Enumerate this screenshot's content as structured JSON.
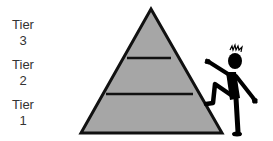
{
  "diagram": {
    "title": "",
    "tiers": [
      {
        "word": "Tier",
        "number": "3"
      },
      {
        "word": "Tier",
        "number": "2"
      },
      {
        "word": "Tier",
        "number": "1"
      }
    ],
    "colors": {
      "pyramid_fill": "#a6a6a6",
      "outline": "#111111",
      "figure": "#000000",
      "label_text": "#333333"
    },
    "figure": "stick-figure-climbing-pyramid"
  }
}
